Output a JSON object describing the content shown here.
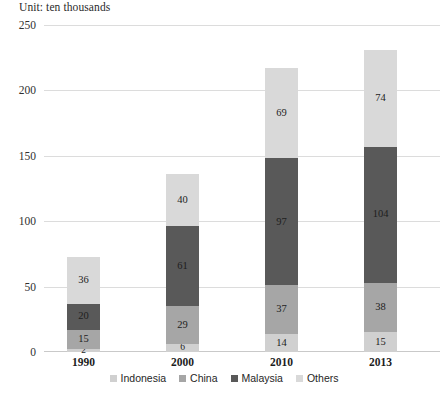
{
  "caption": "Unit: ten thousands",
  "chart_data": {
    "type": "bar",
    "subtype": "stacked-bar",
    "title": "",
    "subtitle": "",
    "unit_note": "Unit: ten thousands",
    "xlabel": "",
    "ylabel": "",
    "ylim": [
      0,
      250
    ],
    "yticks": [
      0,
      50,
      100,
      150,
      200,
      250
    ],
    "ytick_labels": [
      "0",
      "50",
      "100",
      "150",
      "200",
      "250"
    ],
    "grid": true,
    "legend_position": "bottom",
    "categories": [
      "1990",
      "2000",
      "2010",
      "2013"
    ],
    "series": [
      {
        "name": "Indonesia",
        "color": "#d0d0d0",
        "values": [
          2,
          6,
          14,
          15
        ]
      },
      {
        "name": "China",
        "color": "#a6a6a6",
        "values": [
          15,
          29,
          37,
          38
        ]
      },
      {
        "name": "Malaysia",
        "color": "#595959",
        "values": [
          20,
          61,
          97,
          104
        ]
      },
      {
        "name": "Others",
        "color": "#d9d9d9",
        "values": [
          36,
          40,
          69,
          74
        ]
      }
    ],
    "totals": [
      73,
      136,
      217,
      231
    ]
  },
  "legend": {
    "items": [
      {
        "label": "Indonesia",
        "color": "#d0d0d0"
      },
      {
        "label": "China",
        "color": "#a6a6a6"
      },
      {
        "label": "Malaysia",
        "color": "#595959"
      },
      {
        "label": "Others",
        "color": "#d9d9d9"
      }
    ]
  },
  "axis": {
    "y_ticks": [
      "0",
      "50",
      "100",
      "150",
      "200",
      "250"
    ],
    "x_ticks": [
      "1990",
      "2000",
      "2010",
      "2013"
    ]
  }
}
